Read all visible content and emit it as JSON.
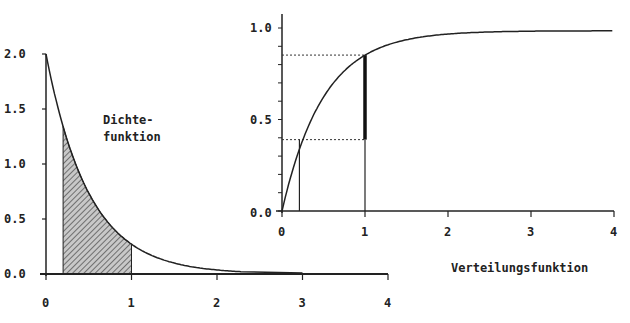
{
  "chart_data": [
    {
      "type": "area",
      "title": "Dichtefunktion",
      "label_lines": [
        "Dichte-",
        "funktion"
      ],
      "function": "f(x) = 2·e^(-2x)",
      "xlabel": "",
      "ylabel": "",
      "xlim": [
        0,
        4
      ],
      "ylim": [
        0,
        2.0
      ],
      "xticks": [
        "0",
        "1",
        "2",
        "3",
        "4"
      ],
      "yticks": [
        "0.0",
        "0.5",
        "1.0",
        "1.5",
        "2.0"
      ],
      "x": [
        0,
        0.25,
        0.5,
        0.75,
        1.0,
        1.5,
        2.0,
        2.3
      ],
      "values": [
        2.0,
        1.21,
        0.74,
        0.45,
        0.27,
        0.1,
        0.04,
        0.02
      ],
      "shaded_interval": [
        0.2,
        1.0
      ],
      "grid": false
    },
    {
      "type": "line",
      "title": "Verteilungsfunktion",
      "function": "F(x) = 1 - e^(-2x)",
      "xlabel": "",
      "ylabel": "",
      "xlim": [
        0,
        4
      ],
      "ylim": [
        0,
        1.0
      ],
      "xticks": [
        "0",
        "1",
        "2",
        "3",
        "4"
      ],
      "yticks": [
        "0.0",
        "0.5",
        "1.0"
      ],
      "x": [
        0,
        0.25,
        0.5,
        1.0,
        1.5,
        2.0,
        3.0,
        4.0
      ],
      "values": [
        0.0,
        0.39,
        0.63,
        0.86,
        0.95,
        0.98,
        1.0,
        1.0
      ],
      "markers": [
        {
          "x": 0.2,
          "y": 0.39
        },
        {
          "x": 1.0,
          "y": 0.86
        }
      ],
      "highlight_segment": {
        "x": 1.0,
        "from": 0.39,
        "to": 0.86
      },
      "grid": false
    }
  ],
  "labels": {
    "density_line1": "Dichte-",
    "density_line2": "funktion",
    "cdf": "Verteilungsfunktion"
  },
  "left_axis": {
    "xticks": [
      "0",
      "1",
      "2",
      "3",
      "4"
    ],
    "yticks": [
      "0.0",
      "0.5",
      "1.0",
      "1.5",
      "2.0"
    ]
  },
  "right_axis": {
    "xticks": [
      "0",
      "1",
      "2",
      "3",
      "4"
    ],
    "yticks": [
      "0.0",
      "0.5",
      "1.0"
    ]
  }
}
